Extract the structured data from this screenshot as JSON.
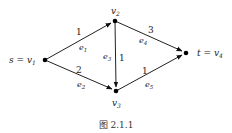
{
  "caption": "图 2.1.1",
  "nodes": [
    {
      "id": "v1",
      "label": "s = v",
      "sub": "1",
      "x": 45,
      "y": 60
    },
    {
      "id": "v2",
      "label": "v",
      "sub": "2",
      "x": 115,
      "y": 21
    },
    {
      "id": "v3",
      "label": "v",
      "sub": "3",
      "x": 116,
      "y": 91
    },
    {
      "id": "v4",
      "label": "t = v",
      "sub": "4",
      "x": 186,
      "y": 53
    }
  ],
  "edges": [
    {
      "id": "e1",
      "from": "v1",
      "to": "v2",
      "weight": "1",
      "name": "e",
      "sub": "1"
    },
    {
      "id": "e2",
      "from": "v1",
      "to": "v3",
      "weight": "2",
      "name": "e",
      "sub": "2"
    },
    {
      "id": "e3",
      "from": "v2",
      "to": "v3",
      "weight": "1",
      "name": "e",
      "sub": "3"
    },
    {
      "id": "e4",
      "from": "v2",
      "to": "v4",
      "weight": "3",
      "name": "e",
      "sub": "4"
    },
    {
      "id": "e5",
      "from": "v3",
      "to": "v4",
      "weight": "1",
      "name": "e",
      "sub": "5"
    }
  ]
}
